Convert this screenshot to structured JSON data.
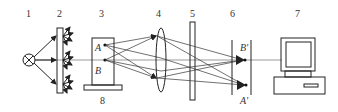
{
  "diagram": {
    "component_numbers": {
      "light_source": "1",
      "diffuser_screen": "2",
      "object": "3",
      "lens": "4",
      "plate": "5",
      "image_plane": "6",
      "computer": "7",
      "object_base": "8"
    },
    "point_labels": {
      "object_point_a": "A",
      "object_point_b": "B",
      "image_point_b": "B′",
      "image_point_a": "A′"
    },
    "colors": {
      "line": "#222222",
      "axis": "#999999",
      "text": "#333333",
      "background": "#ffffff"
    }
  }
}
